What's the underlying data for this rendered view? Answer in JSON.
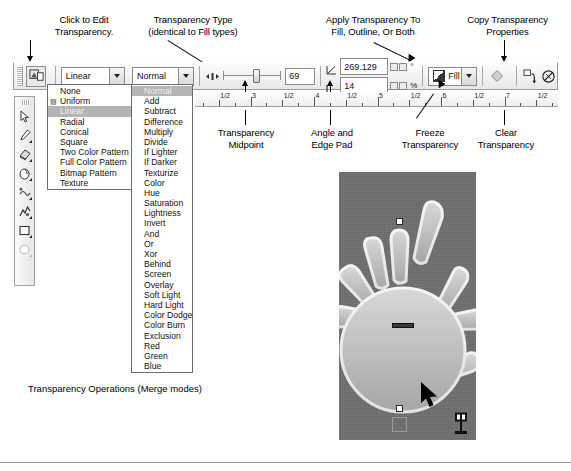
{
  "annotations": {
    "click_to_edit": "Click to Edit\nTransparency.",
    "transparency_type": "Transparency Type\n(identical to Fill types)",
    "apply_to": "Apply Transparency To\nFill, Outline, Or Both",
    "copy_props": "Copy Transparency\nProperties",
    "midpoint": "Transparency\nMidpoint",
    "angle_edge": "Angle and\nEdge Pad",
    "freeze": "Freeze\nTransparency",
    "clear": "Clear\nTransparency"
  },
  "caption": "Transparency Operations (Merge modes)",
  "toolbar": {
    "edit_transparency_tooltip": "Edit Transparency",
    "type_combo": {
      "value": "Linear",
      "options": [
        "None",
        "Uniform",
        "Linear",
        "Radial",
        "Conical",
        "Square",
        "Two Color Pattern",
        "Full Color Pattern",
        "Bitmap Pattern",
        "Texture"
      ],
      "selected": "Linear"
    },
    "merge_combo": {
      "value": "Normal",
      "options": [
        "Normal",
        "Add",
        "Subtract",
        "Difference",
        "Multiply",
        "Divide",
        "If Lighter",
        "If Darker",
        "Texturize",
        "Color",
        "Hue",
        "Saturation",
        "Lightness",
        "Invert",
        "And",
        "Or",
        "Xor",
        "Behind",
        "Screen",
        "Overlay",
        "Soft Light",
        "Hard Light",
        "Color Dodge",
        "Color Burn",
        "Exclusion",
        "Red",
        "Green",
        "Blue"
      ],
      "selected": "Normal"
    },
    "midpoint_value": "69",
    "angle_value": "269.129",
    "angle_unit": "°",
    "edge_pad_value": "14",
    "edge_pad_unit": "%",
    "apply_combo": {
      "value": "Fill"
    },
    "freeze_label": "Freeze Transparency",
    "copy_label": "Copy Transparency Properties",
    "clear_label": "Clear Transparency"
  },
  "ruler": {
    "unit_labels": [
      "2",
      "1/2",
      "3",
      "3",
      "1/2",
      "4",
      "4",
      "1/2",
      "5",
      "5",
      "1/2",
      "6",
      "6",
      "1/2",
      "7"
    ],
    "major": [
      "2",
      "3",
      "4",
      "5",
      "6",
      "7"
    ],
    "half": "1/2"
  },
  "palette": {
    "tools": [
      "pick-tool",
      "shape-tool",
      "eraser-tool",
      "smudge-tool",
      "add-node-tool",
      "roughen-tool",
      "rectangle-tool",
      "ellipse-tool"
    ]
  },
  "artwork": {
    "name": "hand-sun-shape",
    "background_color": "#6f6f6f",
    "shape_color": "#b9b9b9",
    "outline_color": "#ececec"
  },
  "colors": {
    "toolbar_bg": "#ededed",
    "popup_highlight": "#b4b4b4",
    "border": "#8a8a8a",
    "text": "#111111"
  }
}
